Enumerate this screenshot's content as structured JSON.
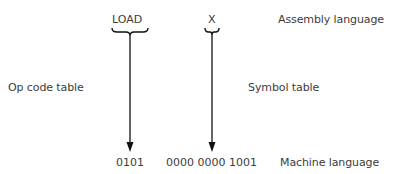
{
  "diagram": {
    "assembly": {
      "opcode": "LOAD",
      "operand": "X",
      "label": "Assembly language"
    },
    "tables": {
      "opcode_table": "Op code table",
      "symbol_table": "Symbol table"
    },
    "machine": {
      "opcode_bits": "0101",
      "operand_bits": "0000 0000 1001",
      "label": "Machine language"
    },
    "colors": {
      "line": "#111111",
      "text": "#3c3c3c",
      "background": "#ffffff"
    }
  }
}
